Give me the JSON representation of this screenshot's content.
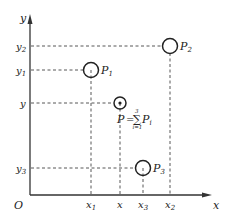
{
  "diagram": {
    "axes": {
      "x_label": "x",
      "y_label": "y",
      "origin_label": "O"
    },
    "points": [
      {
        "id": "P1",
        "label": "P",
        "sub": "1",
        "x_label": "x",
        "x_sub": "1",
        "y_label": "y",
        "y_sub": "1"
      },
      {
        "id": "P2",
        "label": "P",
        "sub": "2",
        "x_label": "x",
        "x_sub": "2",
        "y_label": "y",
        "y_sub": "2"
      },
      {
        "id": "P3",
        "label": "P",
        "sub": "3",
        "x_label": "x",
        "x_sub": "3",
        "y_label": "y",
        "y_sub": "3"
      },
      {
        "id": "P",
        "label": "P",
        "x_label": "x",
        "y_label": "y"
      }
    ],
    "formula": {
      "lhs": "P",
      "equals": "=",
      "sum_symbol": "∑",
      "upper": "3",
      "lower": "i=1",
      "term": "P",
      "term_sub": "i"
    },
    "colors": {
      "line": "#333333",
      "background": "#ffffff"
    }
  }
}
